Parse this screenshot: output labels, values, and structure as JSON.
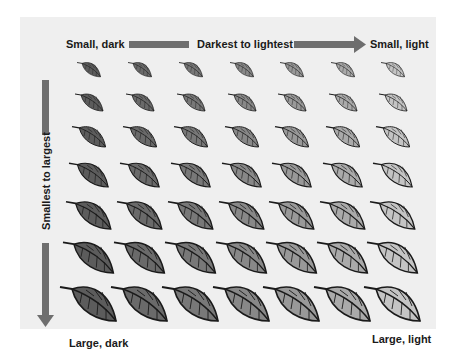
{
  "labels": {
    "top_left": "Small, dark",
    "horizontal_axis": "Darkest to lightest",
    "top_right": "Small, light",
    "vertical_axis": "Smallest to largest",
    "bottom_left": "Large, dark",
    "bottom_right": "Large, light"
  },
  "colors": {
    "panel_background": "#efefef",
    "arrow": "#6e6e6e",
    "leaf_outline": "#1a1a1a"
  },
  "grid": {
    "columns": 7,
    "rows": 7,
    "column_centers_x": [
      90,
      141,
      192,
      243,
      293,
      344,
      394
    ],
    "row_centers_y": [
      70,
      102,
      137,
      175,
      215,
      258,
      304
    ],
    "row_scales": [
      0.42,
      0.5,
      0.6,
      0.7,
      0.8,
      0.9,
      1.0
    ],
    "column_fills": [
      "#5c5c5c",
      "#6a6a6a",
      "#787878",
      "#888888",
      "#999999",
      "#aaaaaa",
      "#c4c4c4"
    ]
  }
}
